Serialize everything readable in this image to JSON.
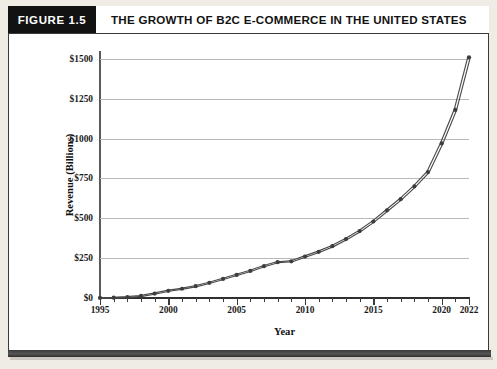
{
  "figure": {
    "badge_label": "FIGURE 1.5",
    "title": "THE GROWTH OF B2C E-COMMERCE IN THE UNITED STATES"
  },
  "colors": {
    "badge_background": "#121212",
    "badge_text": "#ffffff",
    "frame_border": "#3a3a3a",
    "page_background": "#efece5",
    "plot_background": "#ffffff",
    "gridline": "#b9b9b9",
    "axis": "#2f2f2f",
    "series_line": "#4a4a4a",
    "series_marker": "#3d3d3d"
  },
  "chart_data": {
    "type": "line",
    "title": "THE GROWTH OF B2C E-COMMERCE IN THE UNITED STATES",
    "xlabel": "Year",
    "ylabel": "Revenue (Billions)",
    "xlim": [
      1995,
      2022
    ],
    "ylim": [
      0,
      1550
    ],
    "grid": true,
    "legend": "none",
    "y_ticks": [
      0,
      250,
      500,
      750,
      1000,
      1250,
      1500
    ],
    "y_tick_labels": [
      "$0",
      "$250",
      "$500",
      "$750",
      "$1000",
      "$1250",
      "$1500"
    ],
    "x_ticks": [
      1995,
      2000,
      2005,
      2010,
      2015,
      2020,
      2022
    ],
    "x_tick_labels": [
      "1995",
      "2000",
      "2005",
      "2010",
      "2015",
      "2020",
      "2022"
    ],
    "x_minor_ticks": [
      1995,
      1996,
      1997,
      1998,
      1999,
      2000,
      2001,
      2002,
      2003,
      2004,
      2005,
      2006,
      2007,
      2008,
      2009,
      2010,
      2011,
      2012,
      2013,
      2014,
      2015,
      2016,
      2017,
      2018,
      2019,
      2020,
      2021,
      2022
    ],
    "marker": "circle",
    "line_style": "dashed-double",
    "x": [
      1995,
      1996,
      1997,
      1998,
      1999,
      2000,
      2001,
      2002,
      2003,
      2004,
      2005,
      2006,
      2007,
      2008,
      2009,
      2010,
      2011,
      2012,
      2013,
      2014,
      2015,
      2016,
      2017,
      2018,
      2019,
      2020,
      2021,
      2022
    ],
    "values": [
      0.4,
      2,
      6,
      13,
      28,
      45,
      58,
      74,
      95,
      120,
      145,
      170,
      200,
      225,
      230,
      260,
      290,
      325,
      370,
      420,
      480,
      550,
      620,
      700,
      790,
      970,
      1180,
      1510
    ],
    "series": [
      {
        "name": "B2C e-commerce revenue",
        "values": [
          0.4,
          2,
          6,
          13,
          28,
          45,
          58,
          74,
          95,
          120,
          145,
          170,
          200,
          225,
          230,
          260,
          290,
          325,
          370,
          420,
          480,
          550,
          620,
          700,
          790,
          970,
          1180,
          1510
        ]
      }
    ]
  }
}
